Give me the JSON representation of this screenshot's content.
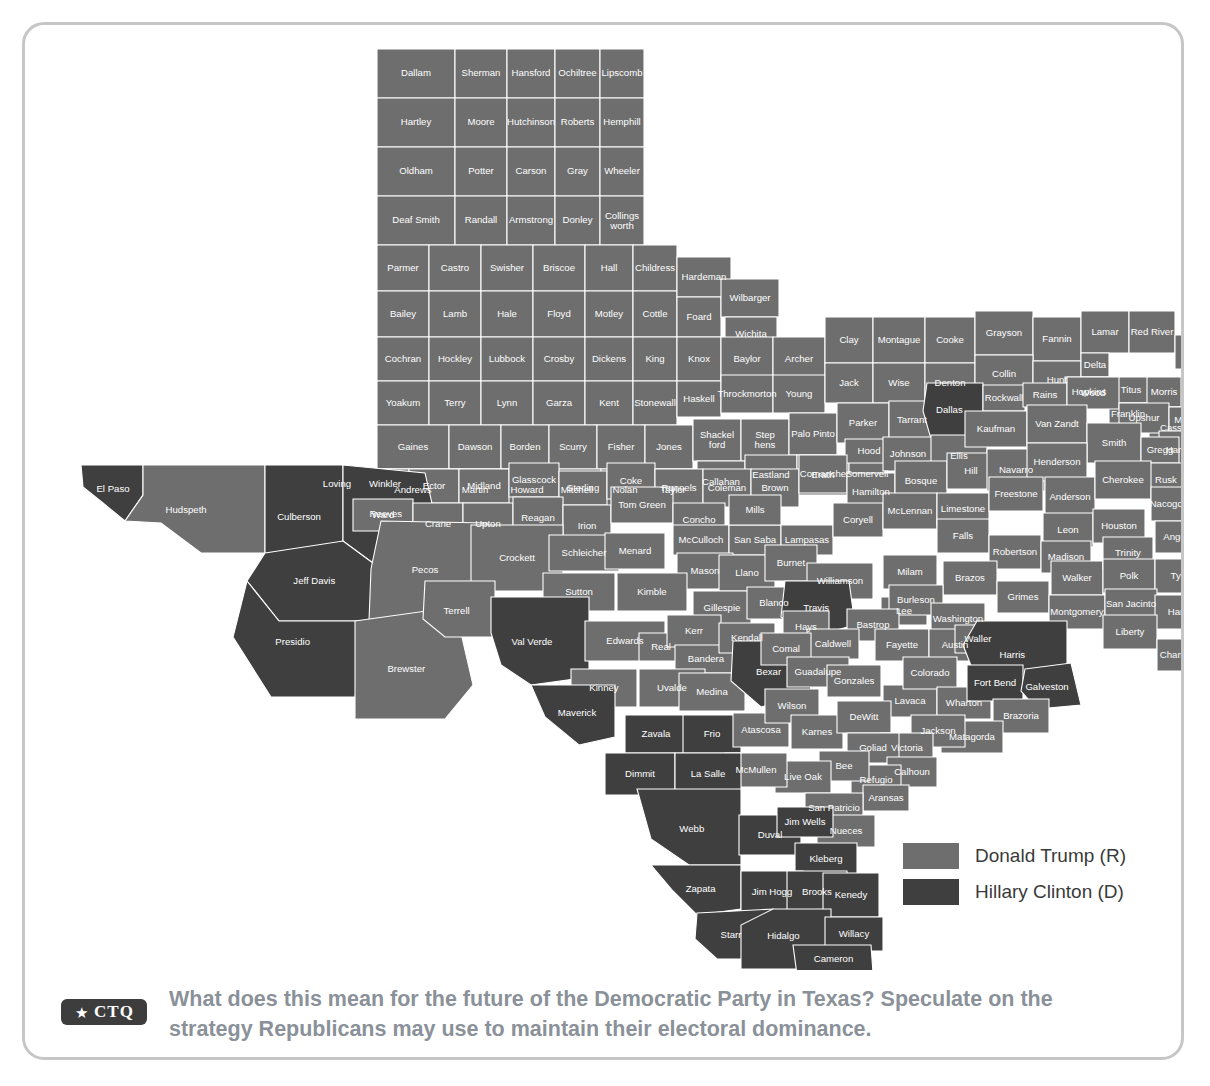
{
  "card": {
    "border_color": "#c6c6c6"
  },
  "map": {
    "title": "Texas 2016 Presidential Election Results by County",
    "colors": {
      "trump": "#6e6e6e",
      "clinton": "#3f3f3f",
      "border": "#ffffff",
      "label": "#ffffff"
    }
  },
  "legend": {
    "items": [
      {
        "label": "Donald Trump (R)",
        "color": "#6e6e6e",
        "key": "trump"
      },
      {
        "label": "Hillary Clinton (D)",
        "color": "#3f3f3f",
        "key": "clinton"
      }
    ]
  },
  "footer": {
    "badge_star": "★",
    "badge_text": "CTQ",
    "prompt": "What does this mean for the future of the Democratic Party in Texas? Speculate on the strategy Republicans may use to maintain their electoral dominance."
  },
  "chart_data": {
    "type": "map",
    "legend_position": "bottom-right",
    "categories": [
      "Donald Trump (R)",
      "Hillary Clinton (D)"
    ],
    "colors": [
      "#6e6e6e",
      "#3f3f3f"
    ],
    "clinton_counties": [
      "El Paso",
      "Culberson",
      "Reeves",
      "Jeff Davis",
      "Presidio",
      "Val Verde",
      "Maverick",
      "Zavala",
      "Dimmit",
      "La Salle",
      "Frio",
      "Webb",
      "Zapata",
      "Jim Hogg",
      "Starr",
      "Hidalgo",
      "Willacy",
      "Cameron",
      "Brooks",
      "Duval",
      "Jim Wells",
      "Kleberg",
      "Kenedy",
      "Bexar",
      "Dallas",
      "Travis",
      "Harris",
      "Fort Bend",
      "Galveston"
    ],
    "counties": [
      {
        "name": "Dallam",
        "winner": "trump"
      },
      {
        "name": "Sherman",
        "winner": "trump"
      },
      {
        "name": "Hansford",
        "winner": "trump"
      },
      {
        "name": "Ochiltree",
        "winner": "trump"
      },
      {
        "name": "Lipscomb",
        "winner": "trump"
      },
      {
        "name": "Hartley",
        "winner": "trump"
      },
      {
        "name": "Moore",
        "winner": "trump"
      },
      {
        "name": "Hutchinson",
        "winner": "trump"
      },
      {
        "name": "Roberts",
        "winner": "trump"
      },
      {
        "name": "Hemphill",
        "winner": "trump"
      },
      {
        "name": "Oldham",
        "winner": "trump"
      },
      {
        "name": "Potter",
        "winner": "trump"
      },
      {
        "name": "Carson",
        "winner": "trump"
      },
      {
        "name": "Gray",
        "winner": "trump"
      },
      {
        "name": "Wheeler",
        "winner": "trump"
      },
      {
        "name": "Deaf Smith",
        "winner": "trump"
      },
      {
        "name": "Randall",
        "winner": "trump"
      },
      {
        "name": "Armstrong",
        "winner": "trump"
      },
      {
        "name": "Donley",
        "winner": "trump"
      },
      {
        "name": "Collings-worth",
        "winner": "trump"
      },
      {
        "name": "Parmer",
        "winner": "trump"
      },
      {
        "name": "Castro",
        "winner": "trump"
      },
      {
        "name": "Swisher",
        "winner": "trump"
      },
      {
        "name": "Briscoe",
        "winner": "trump"
      },
      {
        "name": "Hall",
        "winner": "trump"
      },
      {
        "name": "Childress",
        "winner": "trump"
      },
      {
        "name": "Bailey",
        "winner": "trump"
      },
      {
        "name": "Lamb",
        "winner": "trump"
      },
      {
        "name": "Hale",
        "winner": "trump"
      },
      {
        "name": "Floyd",
        "winner": "trump"
      },
      {
        "name": "Motley",
        "winner": "trump"
      },
      {
        "name": "Cottle",
        "winner": "trump"
      },
      {
        "name": "Hardeman",
        "winner": "trump"
      },
      {
        "name": "Foard",
        "winner": "trump"
      },
      {
        "name": "Wilbarger",
        "winner": "trump"
      },
      {
        "name": "Wichita",
        "winner": "trump"
      },
      {
        "name": "Cochran",
        "winner": "trump"
      },
      {
        "name": "Hockley",
        "winner": "trump"
      },
      {
        "name": "Lubbock",
        "winner": "trump"
      },
      {
        "name": "Crosby",
        "winner": "trump"
      },
      {
        "name": "Dickens",
        "winner": "trump"
      },
      {
        "name": "King",
        "winner": "trump"
      },
      {
        "name": "Knox",
        "winner": "trump"
      },
      {
        "name": "Baylor",
        "winner": "trump"
      },
      {
        "name": "Archer",
        "winner": "trump"
      },
      {
        "name": "Clay",
        "winner": "trump"
      },
      {
        "name": "Montague",
        "winner": "trump"
      },
      {
        "name": "Cooke",
        "winner": "trump"
      },
      {
        "name": "Grayson",
        "winner": "trump"
      },
      {
        "name": "Fannin",
        "winner": "trump"
      },
      {
        "name": "Lamar",
        "winner": "trump"
      },
      {
        "name": "Red River",
        "winner": "trump"
      },
      {
        "name": "Bowie",
        "winner": "trump"
      },
      {
        "name": "Yoakum",
        "winner": "trump"
      },
      {
        "name": "Terry",
        "winner": "trump"
      },
      {
        "name": "Lynn",
        "winner": "trump"
      },
      {
        "name": "Garza",
        "winner": "trump"
      },
      {
        "name": "Kent",
        "winner": "trump"
      },
      {
        "name": "Stonewall",
        "winner": "trump"
      },
      {
        "name": "Haskell",
        "winner": "trump"
      },
      {
        "name": "Throckmorton",
        "winner": "trump"
      },
      {
        "name": "Young",
        "winner": "trump"
      },
      {
        "name": "Jack",
        "winner": "trump"
      },
      {
        "name": "Wise",
        "winner": "trump"
      },
      {
        "name": "Denton",
        "winner": "trump"
      },
      {
        "name": "Collin",
        "winner": "trump"
      },
      {
        "name": "Hunt",
        "winner": "trump"
      },
      {
        "name": "Delta",
        "winner": "trump"
      },
      {
        "name": "Hopkins",
        "winner": "trump"
      },
      {
        "name": "Titus",
        "winner": "trump"
      },
      {
        "name": "Franklin",
        "winner": "trump"
      },
      {
        "name": "Morris",
        "winner": "trump"
      },
      {
        "name": "Cass",
        "winner": "trump"
      },
      {
        "name": "Gaines",
        "winner": "trump"
      },
      {
        "name": "Dawson",
        "winner": "trump"
      },
      {
        "name": "Borden",
        "winner": "trump"
      },
      {
        "name": "Scurry",
        "winner": "trump"
      },
      {
        "name": "Fisher",
        "winner": "trump"
      },
      {
        "name": "Jones",
        "winner": "trump"
      },
      {
        "name": "Shackel-ford",
        "winner": "trump"
      },
      {
        "name": "Step-hens",
        "winner": "trump"
      },
      {
        "name": "Palo Pinto",
        "winner": "trump"
      },
      {
        "name": "Parker",
        "winner": "trump"
      },
      {
        "name": "Tarrant",
        "winner": "trump"
      },
      {
        "name": "Dallas",
        "winner": "clinton"
      },
      {
        "name": "Rockwall",
        "winner": "trump"
      },
      {
        "name": "Rains",
        "winner": "trump"
      },
      {
        "name": "Wood",
        "winner": "trump"
      },
      {
        "name": "Upshur",
        "winner": "trump"
      },
      {
        "name": "Marion",
        "winner": "trump"
      },
      {
        "name": "Harrison",
        "winner": "trump"
      },
      {
        "name": "Andrews",
        "winner": "trump"
      },
      {
        "name": "Martin",
        "winner": "trump"
      },
      {
        "name": "Howard",
        "winner": "trump"
      },
      {
        "name": "Mitchell",
        "winner": "trump"
      },
      {
        "name": "Nolan",
        "winner": "trump"
      },
      {
        "name": "Taylor",
        "winner": "trump"
      },
      {
        "name": "Callahan",
        "winner": "trump"
      },
      {
        "name": "Eastland",
        "winner": "trump"
      },
      {
        "name": "Erath",
        "winner": "trump"
      },
      {
        "name": "Somervell",
        "winner": "trump"
      },
      {
        "name": "Hood",
        "winner": "trump"
      },
      {
        "name": "Johnson",
        "winner": "trump"
      },
      {
        "name": "Ellis",
        "winner": "trump"
      },
      {
        "name": "Kaufman",
        "winner": "trump"
      },
      {
        "name": "Van Zandt",
        "winner": "trump"
      },
      {
        "name": "Smith",
        "winner": "trump"
      },
      {
        "name": "Gregg",
        "winner": "trump"
      },
      {
        "name": "Rusk",
        "winner": "trump"
      },
      {
        "name": "Panola",
        "winner": "trump"
      },
      {
        "name": "Loving",
        "winner": "trump"
      },
      {
        "name": "Winkler",
        "winner": "trump"
      },
      {
        "name": "Ector",
        "winner": "trump"
      },
      {
        "name": "Midland",
        "winner": "trump"
      },
      {
        "name": "Glasscock",
        "winner": "trump"
      },
      {
        "name": "Sterling",
        "winner": "trump"
      },
      {
        "name": "Coke",
        "winner": "trump"
      },
      {
        "name": "Runnels",
        "winner": "trump"
      },
      {
        "name": "Coleman",
        "winner": "trump"
      },
      {
        "name": "Brown",
        "winner": "trump"
      },
      {
        "name": "Comanche",
        "winner": "trump"
      },
      {
        "name": "Hamilton",
        "winner": "trump"
      },
      {
        "name": "Bosque",
        "winner": "trump"
      },
      {
        "name": "Hill",
        "winner": "trump"
      },
      {
        "name": "Navarro",
        "winner": "trump"
      },
      {
        "name": "Henderson",
        "winner": "trump"
      },
      {
        "name": "Anderson",
        "winner": "trump"
      },
      {
        "name": "Cherokee",
        "winner": "trump"
      },
      {
        "name": "Nacogdoches",
        "winner": "trump"
      },
      {
        "name": "Shelby",
        "winner": "trump"
      },
      {
        "name": "El Paso",
        "winner": "clinton"
      },
      {
        "name": "Hudspeth",
        "winner": "trump"
      },
      {
        "name": "Culberson",
        "winner": "clinton"
      },
      {
        "name": "Reeves",
        "winner": "clinton"
      },
      {
        "name": "Ward",
        "winner": "trump"
      },
      {
        "name": "Crane",
        "winner": "trump"
      },
      {
        "name": "Upton",
        "winner": "trump"
      },
      {
        "name": "Reagan",
        "winner": "trump"
      },
      {
        "name": "Irion",
        "winner": "trump"
      },
      {
        "name": "Tom Green",
        "winner": "trump"
      },
      {
        "name": "Concho",
        "winner": "trump"
      },
      {
        "name": "McCulloch",
        "winner": "trump"
      },
      {
        "name": "San Saba",
        "winner": "trump"
      },
      {
        "name": "Mills",
        "winner": "trump"
      },
      {
        "name": "Lampasas",
        "winner": "trump"
      },
      {
        "name": "Coryell",
        "winner": "trump"
      },
      {
        "name": "McLennan",
        "winner": "trump"
      },
      {
        "name": "Limestone",
        "winner": "trump"
      },
      {
        "name": "Freestone",
        "winner": "trump"
      },
      {
        "name": "Leon",
        "winner": "trump"
      },
      {
        "name": "Houston",
        "winner": "trump"
      },
      {
        "name": "Angelina",
        "winner": "trump"
      },
      {
        "name": "San Augustine",
        "winner": "trump"
      },
      {
        "name": "Sabine",
        "winner": "trump"
      },
      {
        "name": "Jeff Davis",
        "winner": "clinton"
      },
      {
        "name": "Pecos",
        "winner": "trump"
      },
      {
        "name": "Crockett",
        "winner": "trump"
      },
      {
        "name": "Schleicher",
        "winner": "trump"
      },
      {
        "name": "Menard",
        "winner": "trump"
      },
      {
        "name": "Mason",
        "winner": "trump"
      },
      {
        "name": "Llano",
        "winner": "trump"
      },
      {
        "name": "Burnet",
        "winner": "trump"
      },
      {
        "name": "Williamson",
        "winner": "trump"
      },
      {
        "name": "Milam",
        "winner": "trump"
      },
      {
        "name": "Falls",
        "winner": "trump"
      },
      {
        "name": "Robertson",
        "winner": "trump"
      },
      {
        "name": "Madison",
        "winner": "trump"
      },
      {
        "name": "Brazos",
        "winner": "trump"
      },
      {
        "name": "Walker",
        "winner": "trump"
      },
      {
        "name": "Trinity",
        "winner": "trump"
      },
      {
        "name": "Polk",
        "winner": "trump"
      },
      {
        "name": "Tyler",
        "winner": "trump"
      },
      {
        "name": "Jasper",
        "winner": "trump"
      },
      {
        "name": "Newton",
        "winner": "trump"
      },
      {
        "name": "Presidio",
        "winner": "clinton"
      },
      {
        "name": "Brewster",
        "winner": "trump"
      },
      {
        "name": "Terrell",
        "winner": "trump"
      },
      {
        "name": "Sutton",
        "winner": "trump"
      },
      {
        "name": "Kimble",
        "winner": "trump"
      },
      {
        "name": "Gillespie",
        "winner": "trump"
      },
      {
        "name": "Blanco",
        "winner": "trump"
      },
      {
        "name": "Travis",
        "winner": "clinton"
      },
      {
        "name": "Lee",
        "winner": "trump"
      },
      {
        "name": "Burleson",
        "winner": "trump"
      },
      {
        "name": "Grimes",
        "winner": "trump"
      },
      {
        "name": "Montgomery",
        "winner": "trump"
      },
      {
        "name": "San Jacinto",
        "winner": "trump"
      },
      {
        "name": "Hardin",
        "winner": "trump"
      },
      {
        "name": "Liberty",
        "winner": "trump"
      },
      {
        "name": "Orange",
        "winner": "trump"
      },
      {
        "name": "Jefferson",
        "winner": "trump"
      },
      {
        "name": "Chambers",
        "winner": "trump"
      },
      {
        "name": "Val Verde",
        "winner": "clinton"
      },
      {
        "name": "Edwards",
        "winner": "trump"
      },
      {
        "name": "Real",
        "winner": "trump"
      },
      {
        "name": "Kerr",
        "winner": "trump"
      },
      {
        "name": "Bandera",
        "winner": "trump"
      },
      {
        "name": "Kendall",
        "winner": "trump"
      },
      {
        "name": "Hays",
        "winner": "trump"
      },
      {
        "name": "Bastrop",
        "winner": "trump"
      },
      {
        "name": "Caldwell",
        "winner": "trump"
      },
      {
        "name": "Fayette",
        "winner": "trump"
      },
      {
        "name": "Washington",
        "winner": "trump"
      },
      {
        "name": "Austin",
        "winner": "trump"
      },
      {
        "name": "Waller",
        "winner": "trump"
      },
      {
        "name": "Harris",
        "winner": "clinton"
      },
      {
        "name": "Kinney",
        "winner": "trump"
      },
      {
        "name": "Uvalde",
        "winner": "trump"
      },
      {
        "name": "Medina",
        "winner": "trump"
      },
      {
        "name": "Bexar",
        "winner": "clinton"
      },
      {
        "name": "Comal",
        "winner": "trump"
      },
      {
        "name": "Guadalupe",
        "winner": "trump"
      },
      {
        "name": "Gonzales",
        "winner": "trump"
      },
      {
        "name": "Lavaca",
        "winner": "trump"
      },
      {
        "name": "Colorado",
        "winner": "trump"
      },
      {
        "name": "Wharton",
        "winner": "trump"
      },
      {
        "name": "Fort Bend",
        "winner": "clinton"
      },
      {
        "name": "Galveston",
        "winner": "clinton"
      },
      {
        "name": "Brazoria",
        "winner": "trump"
      },
      {
        "name": "Matagorda",
        "winner": "trump"
      },
      {
        "name": "Maverick",
        "winner": "clinton"
      },
      {
        "name": "Zavala",
        "winner": "clinton"
      },
      {
        "name": "Frio",
        "winner": "clinton"
      },
      {
        "name": "Atascosa",
        "winner": "trump"
      },
      {
        "name": "Wilson",
        "winner": "trump"
      },
      {
        "name": "Karnes",
        "winner": "trump"
      },
      {
        "name": "DeWitt",
        "winner": "trump"
      },
      {
        "name": "Jackson",
        "winner": "trump"
      },
      {
        "name": "Victoria",
        "winner": "trump"
      },
      {
        "name": "Goliad",
        "winner": "trump"
      },
      {
        "name": "Calhoun",
        "winner": "trump"
      },
      {
        "name": "Refugio",
        "winner": "trump"
      },
      {
        "name": "Aransas",
        "winner": "trump"
      },
      {
        "name": "Bee",
        "winner": "trump"
      },
      {
        "name": "Live Oak",
        "winner": "trump"
      },
      {
        "name": "McMullen",
        "winner": "trump"
      },
      {
        "name": "Dimmit",
        "winner": "clinton"
      },
      {
        "name": "La Salle",
        "winner": "clinton"
      },
      {
        "name": "San Patricio",
        "winner": "trump"
      },
      {
        "name": "Nueces",
        "winner": "trump"
      },
      {
        "name": "Webb",
        "winner": "clinton"
      },
      {
        "name": "Duval",
        "winner": "clinton"
      },
      {
        "name": "Jim Wells",
        "winner": "clinton"
      },
      {
        "name": "Kleberg",
        "winner": "clinton"
      },
      {
        "name": "Zapata",
        "winner": "clinton"
      },
      {
        "name": "Jim Hogg",
        "winner": "clinton"
      },
      {
        "name": "Brooks",
        "winner": "clinton"
      },
      {
        "name": "Kenedy",
        "winner": "clinton"
      },
      {
        "name": "Starr",
        "winner": "clinton"
      },
      {
        "name": "Hidalgo",
        "winner": "clinton"
      },
      {
        "name": "Willacy",
        "winner": "clinton"
      },
      {
        "name": "Cameron",
        "winner": "clinton"
      }
    ]
  }
}
